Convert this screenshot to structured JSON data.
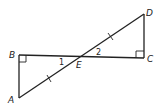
{
  "diagram": {
    "type": "geometry",
    "points": {
      "A": {
        "label": "A"
      },
      "B": {
        "label": "B"
      },
      "C": {
        "label": "C"
      },
      "D": {
        "label": "D"
      },
      "E": {
        "label": "E"
      }
    },
    "angles": {
      "angle1": {
        "label": "1"
      },
      "angle2": {
        "label": "2"
      }
    },
    "right_angles": [
      "B",
      "C"
    ],
    "congruent_marks": [
      "AE",
      "ED"
    ]
  }
}
